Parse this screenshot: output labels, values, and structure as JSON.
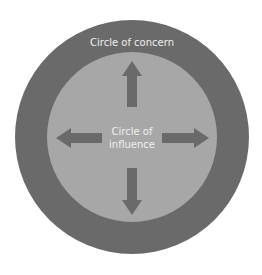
{
  "diagram": {
    "outer_circle": {
      "label": "Circle of concern",
      "color": "#6a6a6a"
    },
    "inner_circle": {
      "label_line1": "Circle of",
      "label_line2": "influence",
      "color": "#a7a7a7"
    },
    "arrows": [
      "up",
      "down",
      "left",
      "right"
    ],
    "arrow_color": "#6a6a6a",
    "text_color": "#efefef"
  }
}
